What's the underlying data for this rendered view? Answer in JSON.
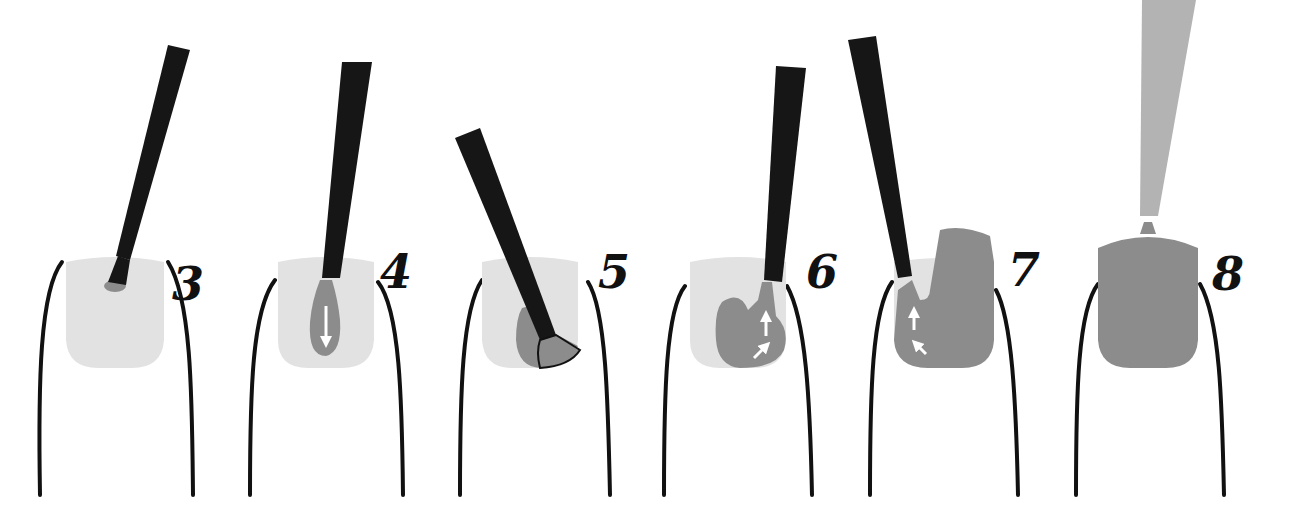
{
  "diagram": {
    "colors": {
      "background": "#ffffff",
      "nail_bare": "#e2e2e2",
      "polish": "#8c8c8c",
      "brush_handle": "#161616",
      "finger_outline": "#111111",
      "final_bottle_stem": "#b3b3b3",
      "arrow": "#ffffff"
    },
    "steps": [
      {
        "number": "3",
        "description": "Drop of polish placed near cuticle"
      },
      {
        "number": "4",
        "description": "Brush polish downward through center",
        "arrow": "down"
      },
      {
        "number": "5",
        "description": "Brush fanned along the side of the nail"
      },
      {
        "number": "6",
        "description": "Polish spread upward on left side",
        "arrows": [
          "up",
          "up-right"
        ]
      },
      {
        "number": "7",
        "description": "Polish spread upward on right side",
        "arrows": [
          "up",
          "up-left"
        ]
      },
      {
        "number": "8",
        "description": "Nail fully coated"
      }
    ]
  }
}
